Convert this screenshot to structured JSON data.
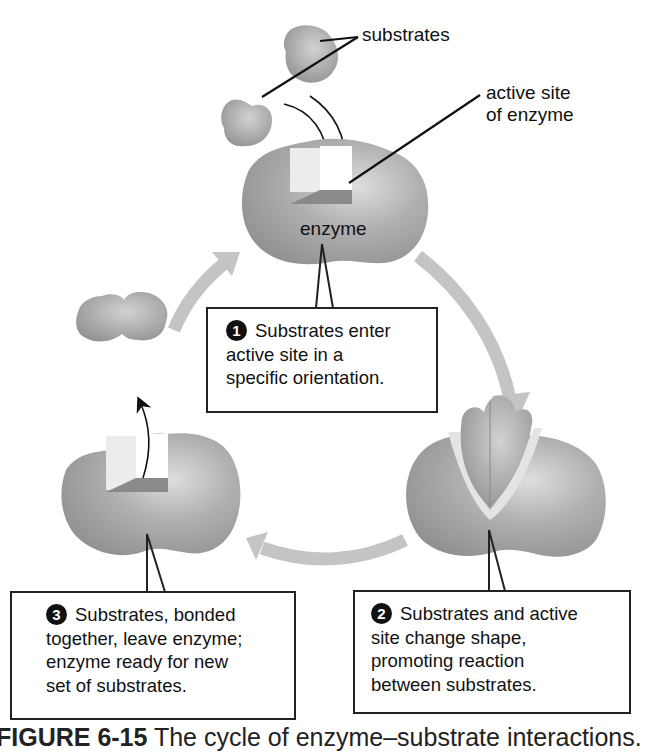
{
  "figure": {
    "labels": {
      "substrates": "substrates",
      "active_site_line1": "active site",
      "active_site_line2": "of enzyme",
      "enzyme": "enzyme"
    },
    "steps": [
      {
        "number": "1",
        "text_lines": [
          "Substrates enter",
          "active site in a",
          "specific orientation."
        ]
      },
      {
        "number": "2",
        "text_lines": [
          "Substrates and active",
          "site change shape,",
          "promoting reaction",
          "between substrates."
        ]
      },
      {
        "number": "3",
        "text_lines": [
          "Substrates, bonded",
          "together, leave enzyme;",
          "enzyme ready for new",
          "set of substrates."
        ]
      }
    ],
    "caption": {
      "figure_id": "FIGURE 6-15",
      "title": "The cycle of enzyme–substrate interactions."
    },
    "colors": {
      "enzyme_gray": "#9a9a9a",
      "enzyme_highlight": "#d6d6d6",
      "cycle_arrow": "#c4c4c4",
      "outline": "#222222"
    }
  }
}
